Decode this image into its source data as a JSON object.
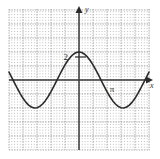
{
  "figure": {
    "type": "line-graph"
  },
  "axes": {
    "x_axis_label": "x",
    "y_axis_label": "y",
    "x_axis_label_color": "#333333",
    "y_axis_label_color": "#333333",
    "axis_color": "#3a3a3a",
    "x_axis_pixel_y": 80,
    "y_axis_pixel_x": 79
  },
  "tick_labels": [
    {
      "name": "y-tick-2",
      "text": "2",
      "axis": "y",
      "value": 2,
      "pixel_x": 70,
      "pixel_y": 57
    },
    {
      "name": "x-tick-pi",
      "text": "π",
      "axis": "x",
      "value": 3.14159,
      "pixel_x": 112,
      "pixel_y": 88
    }
  ],
  "grid": {
    "minor_color": "#b9b9b9",
    "major_color": "#8a8a8a",
    "minor_spacing_px": 2.8,
    "major_spacing_px": 14,
    "left_px": 9,
    "right_px": 150,
    "top_px": 9,
    "bottom_px": 150,
    "grid_visible": true
  },
  "curve": {
    "color": "#2b2b2b",
    "stroke_width": 1.6,
    "name": "cosine-curve"
  },
  "chart_data": {
    "type": "line",
    "title": "",
    "subtitle": "",
    "xlabel": "x",
    "ylabel": "y",
    "grid": true,
    "legend": "none",
    "function": "y = 2*cos(x)",
    "amplitude": 2,
    "period": 6.28319,
    "midline": 0,
    "xlim": [
      -5.0,
      5.07
    ],
    "ylim": [
      -5.07,
      5.07
    ],
    "annotations": [
      "2",
      "π"
    ],
    "x": [
      -5.0,
      -4.8,
      -4.6,
      -4.4,
      -4.2,
      -4.0,
      -3.8,
      -3.6,
      -3.4,
      -3.2,
      -3.0,
      -2.8,
      -2.6,
      -2.4,
      -2.2,
      -2.0,
      -1.8,
      -1.6,
      -1.4,
      -1.2,
      -1.0,
      -0.8,
      -0.6,
      -0.4,
      -0.2,
      0.0,
      0.2,
      0.4,
      0.6,
      0.8,
      1.0,
      1.2,
      1.4,
      1.6,
      1.8,
      2.0,
      2.2,
      2.4,
      2.6,
      2.8,
      3.0,
      3.2,
      3.4,
      3.6,
      3.8,
      4.0,
      4.2,
      4.4,
      4.6,
      4.8,
      5.0
    ],
    "y": [
      0.567,
      0.175,
      -0.22,
      -0.607,
      -0.97,
      -1.307,
      -1.582,
      -1.793,
      -1.931,
      -1.996,
      -1.98,
      -1.885,
      -1.714,
      -1.474,
      -1.177,
      -0.832,
      -0.455,
      -0.058,
      0.34,
      0.725,
      1.081,
      1.393,
      1.651,
      1.842,
      1.96,
      2.0,
      1.96,
      1.842,
      1.651,
      1.393,
      1.081,
      0.725,
      0.34,
      -0.058,
      -0.455,
      -0.832,
      -1.177,
      -1.474,
      -1.714,
      -1.885,
      -1.98,
      -1.996,
      -1.931,
      -1.793,
      -1.582,
      -1.307,
      -0.97,
      -0.607,
      -0.22,
      0.175,
      0.567
    ]
  }
}
